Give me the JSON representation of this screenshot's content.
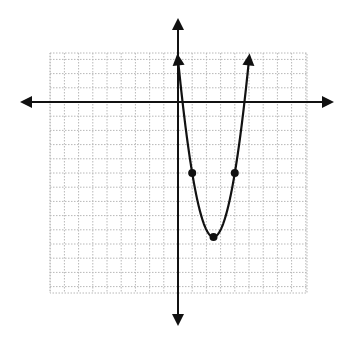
{
  "chart_data": {
    "type": "line",
    "title": "",
    "xlabel": "",
    "ylabel": "",
    "equation": "y = 2x^2 - 10x + 3",
    "vertex": [
      2.5,
      -9.5
    ],
    "grid": true,
    "xlim": [
      -9,
      9
    ],
    "ylim": [
      -13.5,
      3.5
    ],
    "x_axis_arrows": true,
    "y_axis_arrows": true,
    "curve_end_arrows": true,
    "marked_points": [
      {
        "x": 1,
        "y": -5
      },
      {
        "x": 4,
        "y": -5
      },
      {
        "x": 2.5,
        "y": -9.5
      }
    ],
    "series": [
      {
        "name": "parabola",
        "x": [
          0,
          0.5,
          1,
          1.5,
          2,
          2.5,
          3,
          3.5,
          4,
          4.5,
          5
        ],
        "values": [
          3,
          -1.5,
          -5,
          -7.5,
          -9,
          -9.5,
          -9,
          -7.5,
          -5,
          -1.5,
          3
        ]
      }
    ],
    "legend": null
  },
  "colors": {
    "grid": "#b8b8b8",
    "axis": "#111111",
    "curve": "#111111",
    "background": "#ffffff"
  }
}
